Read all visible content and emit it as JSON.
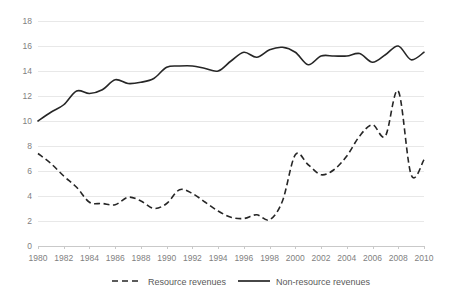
{
  "chart_data": {
    "type": "line",
    "title": "",
    "subtitle": "",
    "xlabel": "",
    "ylabel": "",
    "xlim": [
      1980,
      2010
    ],
    "ylim": [
      0,
      18
    ],
    "y_ticks": [
      0,
      2,
      4,
      6,
      8,
      10,
      12,
      14,
      16,
      18
    ],
    "x_ticks": [
      1980,
      1982,
      1984,
      1986,
      1988,
      1990,
      1992,
      1994,
      1996,
      1998,
      2000,
      2002,
      2004,
      2006,
      2008,
      2010
    ],
    "grid": "horizontal",
    "legend_position": "bottom",
    "x": [
      1980,
      1981,
      1982,
      1983,
      1984,
      1985,
      1986,
      1987,
      1988,
      1989,
      1990,
      1991,
      1992,
      1993,
      1994,
      1995,
      1996,
      1997,
      1998,
      1999,
      2000,
      2001,
      2002,
      2003,
      2004,
      2005,
      2006,
      2007,
      2008,
      2009,
      2010
    ],
    "series": [
      {
        "name": "Resource revenues",
        "style": "dashed",
        "color": "#262626",
        "values": [
          7.4,
          6.6,
          5.6,
          4.7,
          3.5,
          3.4,
          3.3,
          3.9,
          3.6,
          3.0,
          3.4,
          4.5,
          4.2,
          3.5,
          2.8,
          2.3,
          2.2,
          2.5,
          2.1,
          3.6,
          7.3,
          6.5,
          5.7,
          6.1,
          7.2,
          8.8,
          9.7,
          8.8,
          12.4,
          5.7,
          6.9
        ]
      },
      {
        "name": "Non-resource revenues",
        "style": "solid",
        "color": "#262626",
        "values": [
          10.0,
          10.7,
          11.3,
          12.4,
          12.2,
          12.5,
          13.3,
          13.0,
          13.1,
          13.4,
          14.3,
          14.4,
          14.4,
          14.2,
          14.0,
          14.8,
          15.5,
          15.1,
          15.7,
          15.9,
          15.5,
          14.5,
          15.2,
          15.2,
          15.2,
          15.4,
          14.7,
          15.3,
          16.0,
          14.9,
          15.5
        ]
      }
    ]
  },
  "legend": {
    "items": [
      {
        "label": "Resource revenues",
        "style": "dashed"
      },
      {
        "label": "Non-resource revenues",
        "style": "solid"
      }
    ]
  }
}
